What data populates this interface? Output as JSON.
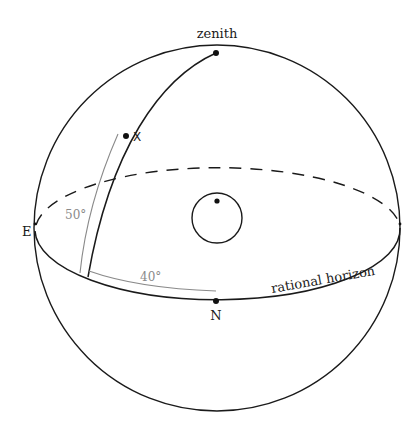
{
  "diagram": {
    "type": "celestial-sphere",
    "labels": {
      "zenith": "zenith",
      "point_x": "X",
      "east": "E",
      "north": "N",
      "horizon": "rational horizon",
      "altitude": "50°",
      "azimuth": "40°"
    },
    "colors": {
      "line": "#1a1a1a",
      "measure": "#8a8a8a",
      "background": "#ffffff"
    },
    "elements": [
      {
        "id": "sphere",
        "shape": "circle",
        "desc": "outer celestial sphere"
      },
      {
        "id": "horizon-front",
        "shape": "half-ellipse",
        "style": "solid"
      },
      {
        "id": "horizon-back",
        "shape": "half-ellipse",
        "style": "dashed"
      },
      {
        "id": "zenith-arc",
        "desc": "arc from zenith through X to horizon"
      },
      {
        "id": "observer-circle",
        "shape": "small circle with dot at center of sphere"
      },
      {
        "id": "altitude-arc",
        "desc": "gray measuring arc, 50°"
      },
      {
        "id": "azimuth-arc",
        "desc": "gray measuring arc along horizon, 40°"
      }
    ]
  }
}
